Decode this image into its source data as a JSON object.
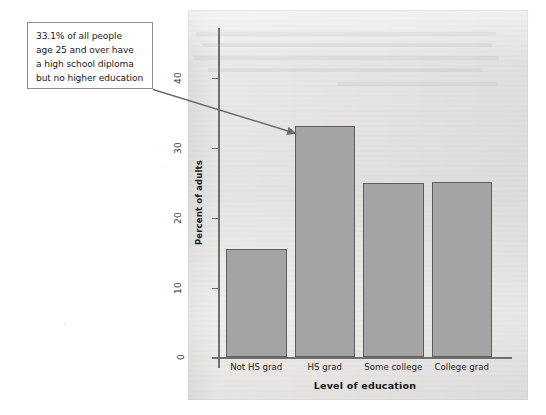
{
  "callout": {
    "name": "statistic-callout",
    "lines": [
      "33.1% of all people",
      "age 25 and over have",
      "a high school diploma",
      "but no higher education"
    ],
    "points_to": "HS grad"
  },
  "chart_data": {
    "type": "bar",
    "title": "",
    "xlabel": "Level of education",
    "ylabel": "Percent of adults",
    "categories": [
      "Not HS grad",
      "HS grad",
      "Some college",
      "College grad"
    ],
    "values": [
      15.4,
      33.1,
      24.9,
      25.0
    ],
    "series": [
      {
        "name": "Percent of adults",
        "values": [
          15.4,
          33.1,
          24.9,
          25.0
        ]
      }
    ],
    "ylim": [
      0,
      44
    ],
    "yticks": [
      0,
      10,
      20,
      30,
      40
    ],
    "ytick_labels": [
      "0",
      "10",
      "20",
      "30",
      "40"
    ],
    "grid": false,
    "legend": "none",
    "annotations": [
      {
        "text": "33.1% of all people age 25 and over have a high school diploma but no higher education",
        "target_category": "HS grad",
        "target_value": 33.1
      }
    ]
  },
  "colors": {
    "page_background": "#ffffff",
    "panel_background": "#e6e5e3",
    "bar_fill": "#a4a4a4",
    "bar_stroke": "#5d5d5d",
    "axis": "#6f6f6f",
    "text": "#1b1b1b",
    "callout_border": "#8c8c8c",
    "leader_line": "#6b6b6b"
  }
}
